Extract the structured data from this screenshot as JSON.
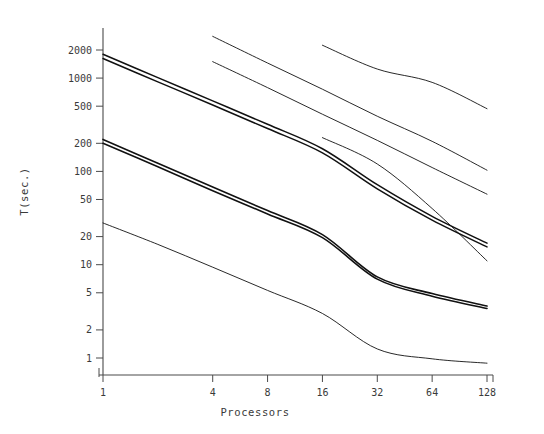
{
  "chart_data": {
    "type": "line",
    "title": "",
    "xlabel": "Processors",
    "ylabel": "T(sec.)",
    "xscale": "log2",
    "yscale": "log10",
    "xlim": [
      1,
      128
    ],
    "ylim": [
      0.8,
      3000
    ],
    "grid": false,
    "legend": "none",
    "xticks": [
      1,
      4,
      8,
      16,
      32,
      64,
      128
    ],
    "xtick_labels": [
      "1",
      "4",
      "8",
      "16",
      "32",
      "64",
      "128"
    ],
    "yticks": [
      1,
      2,
      5,
      10,
      20,
      50,
      100,
      200,
      500,
      1000,
      2000
    ],
    "ytick_labels": [
      "1",
      "2",
      "5",
      "10",
      "20",
      "50",
      "100",
      "200",
      "500",
      "1000",
      "2000"
    ],
    "series": [
      {
        "name": "series-1",
        "stroke_width": 0.9,
        "x": [
          4,
          8,
          16,
          32,
          64,
          128
        ],
        "y": [
          2800,
          1450,
          760,
          390,
          210,
          103
        ]
      },
      {
        "name": "series-2",
        "stroke_width": 0.9,
        "x": [
          16,
          32,
          64,
          128
        ],
        "y": [
          2250,
          1250,
          900,
          470
        ]
      },
      {
        "name": "series-3",
        "stroke_width": 0.9,
        "x": [
          4,
          8,
          16,
          32,
          64,
          128
        ],
        "y": [
          1500,
          790,
          410,
          215,
          110,
          57
        ]
      },
      {
        "name": "series-4",
        "stroke_width": 1.5,
        "x": [
          1,
          2,
          4,
          8,
          16,
          32,
          64,
          128
        ],
        "y": [
          1800,
          1010,
          570,
          320,
          175,
          72,
          33,
          17
        ]
      },
      {
        "name": "series-5",
        "stroke_width": 1.5,
        "x": [
          1,
          2,
          4,
          8,
          16,
          32,
          64,
          128
        ],
        "y": [
          1620,
          910,
          515,
          288,
          158,
          65,
          30,
          15.5
        ]
      },
      {
        "name": "series-6",
        "stroke_width": 0.9,
        "x": [
          16,
          32,
          64,
          128
        ],
        "y": [
          230,
          120,
          40,
          11
        ]
      },
      {
        "name": "series-7",
        "stroke_width": 1.6,
        "x": [
          1,
          2,
          4,
          8,
          16,
          32,
          64,
          128
        ],
        "y": [
          220,
          122,
          68,
          38,
          21,
          7.4,
          4.9,
          3.6
        ]
      },
      {
        "name": "series-8",
        "stroke_width": 1.6,
        "x": [
          1,
          2,
          4,
          8,
          16,
          32,
          64,
          128
        ],
        "y": [
          200,
          112,
          62,
          35,
          19.5,
          7.0,
          4.6,
          3.4
        ]
      },
      {
        "name": "series-9",
        "stroke_width": 0.9,
        "x": [
          1,
          2,
          4,
          8,
          16,
          32,
          64,
          128
        ],
        "y": [
          28,
          16.5,
          9.4,
          5.3,
          3.0,
          1.25,
          0.98,
          0.88
        ]
      }
    ]
  },
  "axes": {
    "colors": {
      "axis": "#4a4a4a",
      "line": "#111111",
      "text": "#3a3a3a",
      "background": "#ffffff"
    }
  }
}
